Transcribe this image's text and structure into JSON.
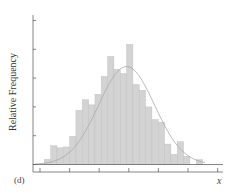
{
  "chart_data": {
    "type": "bar",
    "subtype": "histogram_with_normal_curve",
    "title": "",
    "panel_label": "(d)",
    "xlabel": "x",
    "ylabel": "Relative Frequency",
    "x_tick_count": 7,
    "y_tick_count": 6,
    "grid": false,
    "legend": null,
    "ylim": [
      0,
      5
    ],
    "y_units": "tick intervals (axis unlabeled)",
    "bin_count": 25,
    "bins": [
      1,
      2,
      3,
      4,
      5,
      6,
      7,
      8,
      9,
      10,
      11,
      12,
      13,
      14,
      15,
      16,
      17,
      18,
      19,
      20,
      21,
      22,
      23,
      24,
      25
    ],
    "values": [
      0.18,
      0.65,
      0.58,
      0.61,
      0.98,
      1.88,
      2.25,
      2.07,
      2.44,
      3.06,
      3.75,
      3.31,
      3.16,
      4.17,
      2.78,
      2.58,
      2.0,
      1.56,
      1.47,
      0.71,
      0.35,
      0.79,
      0.29,
      0.0,
      0.17
    ],
    "overlay_curve": {
      "type": "normal_density",
      "peak_bin": 13.5,
      "peak_value": 3.4,
      "color": "#aaaaaa"
    },
    "colors": {
      "bar_fill": "#d3d3d3",
      "bar_edge": "#bdbdbd",
      "axis": "#555555",
      "curve": "#9a9a9a"
    }
  }
}
